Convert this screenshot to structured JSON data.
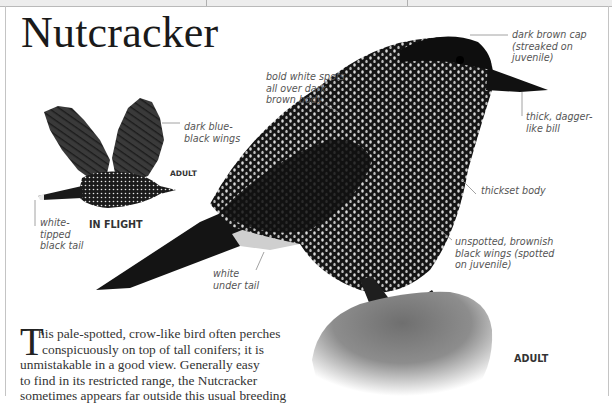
{
  "page": {
    "title": "Nutcracker",
    "body_dropcap": "T",
    "body_lines": [
      "his pale-spotted, crow-like bird often perches",
      "conspicuously on top of tall conifers; it is",
      "unmistakable in a good view. Generally easy",
      "to find in its restricted range, the Nutcracker",
      "sometimes appears far outside this usual breeding"
    ]
  },
  "flight_illustration": {
    "caption": "IN FLIGHT",
    "age_label": "ADULT",
    "annotations": {
      "wings": "dark blue-\nblack wings",
      "tail": "white-\ntipped\nblack tail"
    }
  },
  "perched_illustration": {
    "age_label": "ADULT",
    "annotations": {
      "cap": "dark brown cap\n(streaked on\njuvenile)",
      "spots": "bold white spots\nall over dark\nbrown body",
      "bill": "thick, dagger-\nlike bill",
      "body": "thickset body",
      "wings": "unspotted, brownish\nblack wings (spotted\non juvenile)",
      "under_tail": "white\nunder tail"
    }
  }
}
